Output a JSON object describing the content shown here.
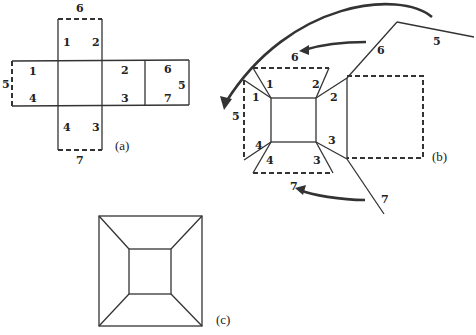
{
  "figure": {
    "panels": [
      {
        "id": "a",
        "caption": "(a)",
        "description": "Cross-shaped net of a box: central square with four flaps; dashed edges mark glued sides",
        "labels": {
          "top_flap": {
            "edge_top": "6",
            "corner_left": "1",
            "corner_right": "2"
          },
          "left_flap": {
            "edge_left": "5",
            "corner_top": "1",
            "corner_bottom": "4"
          },
          "right_flap": {
            "corner_top": "2",
            "corner_bottom": "3"
          },
          "far_right_flap": {
            "top": "6",
            "right": "5",
            "bottom": "7"
          },
          "bottom_flap": {
            "edge_bottom": "7",
            "corner_left": "4",
            "corner_right": "3"
          }
        }
      },
      {
        "id": "b",
        "caption": "(b)",
        "description": "Partially folded net in perspective with arrows showing edges folding together",
        "labels": {
          "top_trapezoid": {
            "left": "1",
            "right": "2"
          },
          "left_trapezoid": {
            "top": "1",
            "bottom": "4",
            "edge": "5"
          },
          "bottom_trapezoid": {
            "left": "4",
            "right": "3"
          },
          "right_side": {
            "top": "2",
            "bottom": "3"
          },
          "far_flap": {
            "edge_6": "6",
            "edge_5": "5",
            "edge_7": "7"
          },
          "arrow_targets": {
            "top_arrow": "6",
            "bottom_arrow": "7"
          }
        }
      },
      {
        "id": "c",
        "caption": "(c)",
        "description": "Folded box seen from above: inner square connected to outer square corners"
      }
    ]
  }
}
